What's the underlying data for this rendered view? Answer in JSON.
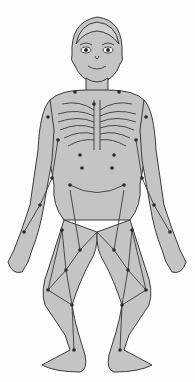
{
  "figure": {
    "colors": {
      "background": "#fdfdfd",
      "body_fill": "#c4c4c4",
      "outline": "#3a3a3a",
      "point": "#2a2a2a"
    }
  }
}
